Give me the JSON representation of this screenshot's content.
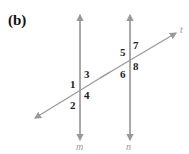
{
  "figure": {
    "label": "(b)",
    "lines": {
      "m": "m",
      "n": "n",
      "t": "t"
    },
    "angles": [
      "1",
      "2",
      "3",
      "4",
      "5",
      "6",
      "7",
      "8"
    ],
    "line_color": "#999999"
  }
}
